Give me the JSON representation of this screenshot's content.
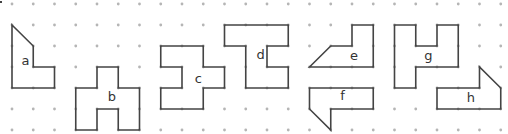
{
  "grid": {
    "origin_x": 12,
    "origin_y": 4,
    "spacing_x": 21.25,
    "spacing_y": 21,
    "cols": 24,
    "rows": 7,
    "dot_color": "#b5b5b5",
    "line_color": "#444444"
  },
  "shapes": [
    {
      "label": "a",
      "label_pos": [
        0.45,
        2.9
      ],
      "points": [
        [
          0,
          1
        ],
        [
          1,
          2
        ],
        [
          1,
          3
        ],
        [
          2,
          3
        ],
        [
          2,
          4
        ],
        [
          0,
          4
        ]
      ]
    },
    {
      "label": "b",
      "label_pos": [
        4.5,
        4.6
      ],
      "points": [
        [
          3,
          4
        ],
        [
          4,
          4
        ],
        [
          4,
          3
        ],
        [
          5,
          3
        ],
        [
          5,
          4
        ],
        [
          6,
          4
        ],
        [
          6,
          6
        ],
        [
          5,
          6
        ],
        [
          5,
          5
        ],
        [
          4,
          5
        ],
        [
          4,
          6
        ],
        [
          3,
          6
        ]
      ]
    },
    {
      "label": "c",
      "label_pos": [
        8.6,
        3.75
      ],
      "points": [
        [
          7,
          2
        ],
        [
          9,
          2
        ],
        [
          9,
          3
        ],
        [
          10,
          3
        ],
        [
          10,
          4
        ],
        [
          9,
          4
        ],
        [
          9,
          5
        ],
        [
          7,
          5
        ],
        [
          7,
          4
        ],
        [
          8,
          4
        ],
        [
          8,
          3
        ],
        [
          7,
          3
        ]
      ]
    },
    {
      "label": "d",
      "label_pos": [
        11.5,
        2.6
      ],
      "points": [
        [
          10,
          1
        ],
        [
          13,
          1
        ],
        [
          13,
          2
        ],
        [
          12,
          2
        ],
        [
          12,
          3
        ],
        [
          13,
          3
        ],
        [
          13,
          4
        ],
        [
          11,
          4
        ],
        [
          11,
          2
        ],
        [
          10,
          2
        ]
      ]
    },
    {
      "label": "e",
      "label_pos": [
        15.9,
        2.65
      ],
      "points": [
        [
          14,
          3
        ],
        [
          15,
          2
        ],
        [
          16,
          2
        ],
        [
          16,
          1
        ],
        [
          17,
          1
        ],
        [
          17,
          3
        ]
      ]
    },
    {
      "label": "f",
      "label_pos": [
        15.45,
        4.55
      ],
      "points": [
        [
          14,
          4
        ],
        [
          17,
          4
        ],
        [
          17,
          5
        ],
        [
          15,
          5
        ],
        [
          15,
          6
        ],
        [
          14,
          5
        ]
      ]
    },
    {
      "label": "g",
      "label_pos": [
        19.4,
        2.65
      ],
      "points": [
        [
          18,
          1
        ],
        [
          19,
          1
        ],
        [
          19,
          2
        ],
        [
          20,
          2
        ],
        [
          20,
          1
        ],
        [
          21,
          1
        ],
        [
          21,
          3
        ],
        [
          19,
          3
        ],
        [
          19,
          4
        ],
        [
          18,
          4
        ]
      ]
    },
    {
      "label": "h",
      "label_pos": [
        21.4,
        4.65
      ],
      "points": [
        [
          20,
          4
        ],
        [
          22,
          4
        ],
        [
          22,
          3
        ],
        [
          23,
          4
        ],
        [
          23,
          5
        ],
        [
          20,
          5
        ]
      ]
    }
  ]
}
